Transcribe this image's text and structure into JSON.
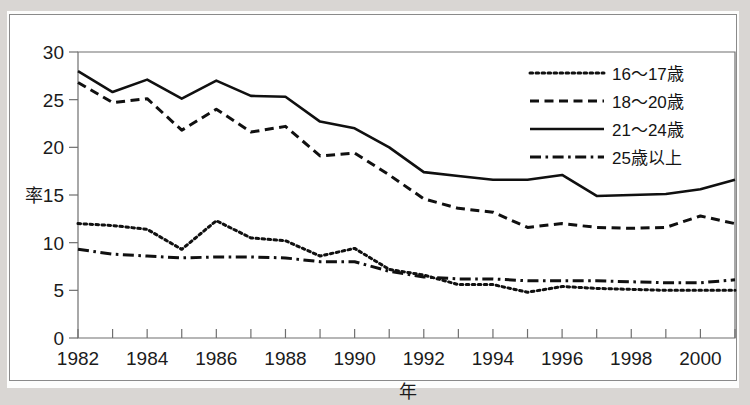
{
  "chart_data": {
    "type": "line",
    "title": "",
    "xlabel": "年",
    "ylabel": "率",
    "x": [
      1982,
      1983,
      1984,
      1985,
      1986,
      1987,
      1988,
      1989,
      1990,
      1991,
      1992,
      1993,
      1994,
      1995,
      1996,
      1997,
      1998,
      1999,
      2000,
      2001
    ],
    "xlim": [
      1982,
      2001
    ],
    "ylim": [
      0,
      30
    ],
    "yticks": [
      0,
      5,
      10,
      15,
      20,
      25,
      30
    ],
    "xticks": [
      1982,
      1984,
      1986,
      1988,
      1990,
      1992,
      1994,
      1996,
      1998,
      2000
    ],
    "xtick_labels": [
      "1982",
      "1984",
      "1986",
      "1988",
      "1990",
      "1992",
      "1994",
      "1996",
      "1998",
      "2000"
    ],
    "ytick_labels": [
      "0",
      "5",
      "10",
      "15",
      "20",
      "25",
      "30"
    ],
    "grid": false,
    "legend_position": "upper right",
    "series": [
      {
        "name": "16〜17歳",
        "style": "dotted",
        "values": [
          12.0,
          11.8,
          11.4,
          9.3,
          12.3,
          10.5,
          10.2,
          8.6,
          9.4,
          7.2,
          6.6,
          5.6,
          5.6,
          4.8,
          5.4,
          5.2,
          5.1,
          5.0,
          5.0,
          5.0
        ]
      },
      {
        "name": "18〜20歳",
        "style": "dashed",
        "values": [
          26.8,
          24.7,
          25.1,
          21.8,
          24.0,
          21.6,
          22.2,
          19.1,
          19.4,
          17.1,
          14.6,
          13.6,
          13.2,
          11.6,
          12.0,
          11.6,
          11.5,
          11.6,
          12.8,
          12.0
        ]
      },
      {
        "name": "21〜24歳",
        "style": "solid",
        "values": [
          28.0,
          25.8,
          27.1,
          25.1,
          27.0,
          25.4,
          25.3,
          22.7,
          22.0,
          20.0,
          17.4,
          17.0,
          16.6,
          16.6,
          17.1,
          14.9,
          15.0,
          15.1,
          15.6,
          16.6
        ]
      },
      {
        "name": "25歳以上",
        "style": "dashdot",
        "values": [
          9.3,
          8.8,
          8.6,
          8.4,
          8.5,
          8.5,
          8.4,
          8.0,
          8.0,
          7.0,
          6.4,
          6.2,
          6.2,
          6.0,
          6.0,
          6.0,
          5.9,
          5.8,
          5.8,
          6.1
        ]
      }
    ]
  },
  "axes": {
    "y_axis_title": "率",
    "x_axis_title": "年"
  },
  "legend": {
    "entries": [
      {
        "label": "16〜17歳",
        "style": "dotted"
      },
      {
        "label": "18〜20歳",
        "style": "dashed"
      },
      {
        "label": "21〜24歳",
        "style": "solid"
      },
      {
        "label": "25歳以上",
        "style": "dashdot"
      }
    ]
  },
  "colors": {
    "line": "#101010",
    "axis": "#6f6f6f",
    "plot_background": "#ffffff",
    "page_background": "#fdfdfc"
  }
}
